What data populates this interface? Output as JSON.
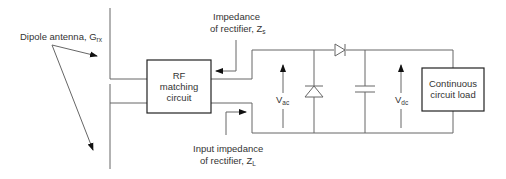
{
  "diagram": {
    "type": "circuit",
    "labels": {
      "antenna_main": "Dipole antenna, G",
      "antenna_sub": "rx",
      "zs_line1": "Impedance",
      "zs_line2_main": "of rectifier, Z",
      "zs_line2_sub": "s",
      "zl_line1": "Input impedance",
      "zl_line2_main": "of rectifier, Z",
      "zl_line2_sub": "L",
      "vac_main": "V",
      "vac_sub": "ac",
      "vdc_main": "V",
      "vdc_sub": "dc"
    },
    "blocks": {
      "rf_line1": "RF",
      "rf_line2": "matching",
      "rf_line3": "circuit",
      "load_line1": "Continuous",
      "load_line2": "circuit load"
    },
    "colors": {
      "stroke": "#555555",
      "box_stroke": "#222222",
      "text": "#333333"
    }
  }
}
